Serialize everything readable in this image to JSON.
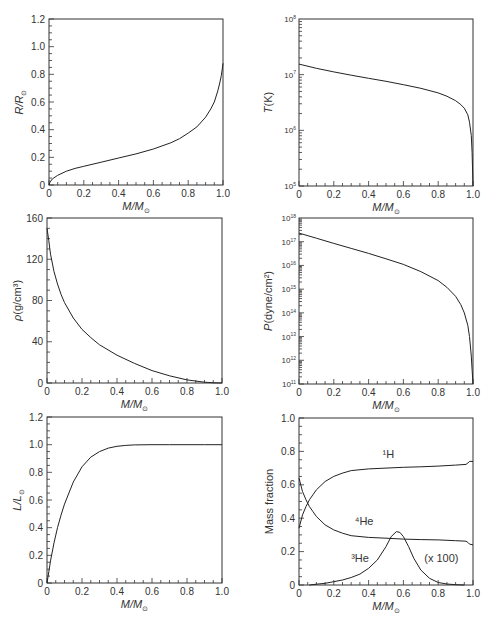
{
  "figure": {
    "xlabel": "M/M⊙",
    "panels_count": 6
  },
  "chart_data": [
    {
      "id": "radius",
      "type": "line",
      "title": "",
      "xlabel": "M/M⊙",
      "ylabel": "R/R⊙",
      "xlim": [
        0,
        1.0
      ],
      "ylim": [
        0,
        1.2
      ],
      "yscale": "linear",
      "xticks": [
        "0",
        "0.2",
        "0.4",
        "0.6",
        "0.8",
        "1.0"
      ],
      "yticks": [
        "0",
        "0.2",
        "0.4",
        "0.6",
        "0.8",
        "1.0",
        "1.2"
      ],
      "grid": false,
      "series": [
        {
          "name": "R/R⊙",
          "x": [
            0,
            0.005,
            0.02,
            0.05,
            0.1,
            0.15,
            0.2,
            0.3,
            0.4,
            0.5,
            0.6,
            0.7,
            0.75,
            0.8,
            0.85,
            0.9,
            0.93,
            0.95,
            0.97,
            0.98,
            0.99,
            0.995,
            1.0
          ],
          "y": [
            0,
            0.02,
            0.045,
            0.07,
            0.1,
            0.12,
            0.135,
            0.165,
            0.195,
            0.225,
            0.26,
            0.305,
            0.335,
            0.375,
            0.42,
            0.49,
            0.55,
            0.6,
            0.68,
            0.73,
            0.79,
            0.83,
            0.88
          ]
        }
      ]
    },
    {
      "id": "temperature",
      "type": "line",
      "title": "",
      "xlabel": "M/M⊙",
      "ylabel": "T(K)",
      "xlim": [
        0,
        1.0
      ],
      "ylim": [
        100000,
        100000000
      ],
      "yscale": "log",
      "xticks": [
        "0",
        "0.2",
        "0.4",
        "0.6",
        "0.8",
        "1.0"
      ],
      "yticks": [
        "10^5",
        "10^6",
        "10^7",
        "10^8"
      ],
      "grid": false,
      "series": [
        {
          "name": "T",
          "x": [
            0,
            0.1,
            0.2,
            0.3,
            0.4,
            0.5,
            0.6,
            0.7,
            0.8,
            0.85,
            0.9,
            0.93,
            0.95,
            0.97,
            0.98,
            0.99,
            0.995,
            1.0
          ],
          "y": [
            15500000,
            13000000,
            11200000,
            9800000,
            8600000,
            7600000,
            6600000,
            5700000,
            4700000,
            4100000,
            3400000,
            2900000,
            2500000,
            1900000,
            1400000,
            800000,
            400000,
            100000
          ]
        }
      ]
    },
    {
      "id": "density",
      "type": "line",
      "title": "",
      "xlabel": "M/M⊙",
      "ylabel": "ρ(g/cm³)",
      "xlim": [
        0,
        1.0
      ],
      "ylim": [
        0,
        160
      ],
      "yscale": "linear",
      "xticks": [
        "0",
        "0.2",
        "0.4",
        "0.6",
        "0.8",
        "1.0"
      ],
      "yticks": [
        "0",
        "40",
        "80",
        "120",
        "160"
      ],
      "grid": false,
      "series": [
        {
          "name": "ρ",
          "x": [
            0,
            0.01,
            0.02,
            0.04,
            0.06,
            0.08,
            0.1,
            0.15,
            0.2,
            0.25,
            0.3,
            0.4,
            0.5,
            0.6,
            0.7,
            0.8,
            0.9,
            0.95,
            1.0
          ],
          "y": [
            150,
            138,
            125,
            108,
            96,
            86,
            78,
            63,
            52,
            44,
            37,
            27,
            19,
            12,
            7,
            3,
            0.8,
            0.2,
            0
          ]
        }
      ]
    },
    {
      "id": "pressure",
      "type": "line",
      "title": "",
      "xlabel": "M/M⊙",
      "ylabel": "P(dyne/cm²)",
      "xlim": [
        0,
        1.0
      ],
      "ylim": [
        100000000000,
        1000000000000000000
      ],
      "yscale": "log",
      "xticks": [
        "0",
        "0.2",
        "0.4",
        "0.6",
        "0.8",
        "1.0"
      ],
      "yticks": [
        "10^11",
        "10^12",
        "10^13",
        "10^14",
        "10^15",
        "10^16",
        "10^17",
        "10^18"
      ],
      "grid": false,
      "series": [
        {
          "name": "P",
          "x": [
            0,
            0.1,
            0.2,
            0.3,
            0.4,
            0.5,
            0.6,
            0.7,
            0.8,
            0.85,
            0.9,
            0.93,
            0.95,
            0.97,
            0.98,
            0.99,
            0.995,
            1.0
          ],
          "y": [
            2.3e+17,
            1.4e+17,
            8.5e+16,
            5.2e+16,
            3.2e+16,
            1.9e+16,
            1.1e+16,
            5500000000000000.0,
            2300000000000000.0,
            1200000000000000.0,
            500000000000000.0,
            220000000000000.0,
            100000000000000.0,
            30000000000000.0,
            10000000000000.0,
            1500000000000.0,
            400000000000.0,
            100000000000.0
          ]
        }
      ]
    },
    {
      "id": "luminosity",
      "type": "line",
      "title": "",
      "xlabel": "M/M⊙",
      "ylabel": "L/L⊙",
      "xlim": [
        0,
        1.0
      ],
      "ylim": [
        0,
        1.2
      ],
      "yscale": "linear",
      "xticks": [
        "0",
        "0.2",
        "0.4",
        "0.6",
        "0.8",
        "1.0"
      ],
      "yticks": [
        "0",
        "0.2",
        "0.4",
        "0.6",
        "0.8",
        "1.0",
        "1.2"
      ],
      "grid": false,
      "series": [
        {
          "name": "L/L⊙",
          "x": [
            0,
            0.01,
            0.02,
            0.04,
            0.06,
            0.08,
            0.1,
            0.15,
            0.2,
            0.25,
            0.3,
            0.35,
            0.4,
            0.45,
            0.5,
            0.6,
            0.7,
            0.8,
            0.9,
            1.0
          ],
          "y": [
            0,
            0.08,
            0.16,
            0.29,
            0.4,
            0.49,
            0.57,
            0.73,
            0.84,
            0.91,
            0.95,
            0.975,
            0.988,
            0.995,
            0.998,
            1.0,
            1.0,
            1.0,
            1.0,
            1.0
          ]
        }
      ]
    },
    {
      "id": "composition",
      "type": "line",
      "title": "",
      "xlabel": "M/M⊙",
      "ylabel": "Mass fraction",
      "xlim": [
        0,
        1.0
      ],
      "ylim": [
        0,
        1.0
      ],
      "yscale": "linear",
      "xticks": [
        "0",
        "0.2",
        "0.4",
        "0.6",
        "0.8",
        "1.0"
      ],
      "yticks": [
        "0",
        "0.2",
        "0.4",
        "0.6",
        "0.8",
        "1.0"
      ],
      "grid": false,
      "annotations": [
        {
          "text": "¹H",
          "x": 0.48,
          "y": 0.76
        },
        {
          "text": "⁴He",
          "x": 0.32,
          "y": 0.36
        },
        {
          "text": "³He",
          "x": 0.3,
          "y": 0.14
        },
        {
          "text": "(x 100)",
          "x": 0.72,
          "y": 0.14
        }
      ],
      "series": [
        {
          "name": "¹H",
          "x": [
            0,
            0.02,
            0.04,
            0.06,
            0.08,
            0.1,
            0.15,
            0.2,
            0.25,
            0.3,
            0.4,
            0.5,
            0.6,
            0.7,
            0.8,
            0.9,
            0.96,
            0.97,
            0.98,
            1.0
          ],
          "y": [
            0.34,
            0.42,
            0.47,
            0.51,
            0.54,
            0.57,
            0.62,
            0.65,
            0.67,
            0.685,
            0.695,
            0.7,
            0.705,
            0.708,
            0.712,
            0.718,
            0.722,
            0.73,
            0.74,
            0.74
          ]
        },
        {
          "name": "⁴He",
          "x": [
            0,
            0.02,
            0.04,
            0.06,
            0.08,
            0.1,
            0.15,
            0.2,
            0.25,
            0.3,
            0.4,
            0.5,
            0.6,
            0.7,
            0.8,
            0.9,
            0.96,
            0.97,
            0.98,
            1.0
          ],
          "y": [
            0.64,
            0.56,
            0.51,
            0.47,
            0.44,
            0.41,
            0.36,
            0.33,
            0.31,
            0.295,
            0.285,
            0.28,
            0.275,
            0.272,
            0.27,
            0.265,
            0.262,
            0.255,
            0.245,
            0.24
          ]
        },
        {
          "name": "³He (x 100)",
          "x": [
            0.06,
            0.1,
            0.15,
            0.2,
            0.25,
            0.3,
            0.35,
            0.4,
            0.45,
            0.5,
            0.53,
            0.56,
            0.58,
            0.6,
            0.63,
            0.66,
            0.7,
            0.75,
            0.8,
            0.85,
            0.9,
            0.95
          ],
          "y": [
            0.0,
            0.005,
            0.01,
            0.02,
            0.03,
            0.045,
            0.065,
            0.1,
            0.15,
            0.23,
            0.29,
            0.32,
            0.315,
            0.29,
            0.23,
            0.16,
            0.09,
            0.04,
            0.015,
            0.006,
            0.002,
            0.0
          ]
        }
      ]
    }
  ]
}
